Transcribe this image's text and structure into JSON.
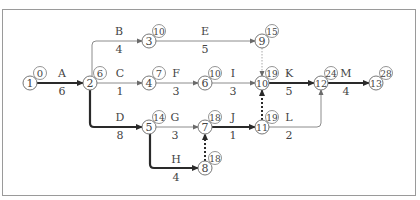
{
  "diagram": {
    "type": "activity-on-arrow network",
    "colors": {
      "line": "#8c8c8c",
      "critical": "#2a2a2a",
      "text": "#444444",
      "frame": "#9a9a9a"
    },
    "nodes": [
      {
        "id": "1",
        "x": 30,
        "y": 83,
        "est": "0"
      },
      {
        "id": "2",
        "x": 90,
        "y": 83,
        "est": "6"
      },
      {
        "id": "3",
        "x": 149,
        "y": 41,
        "est": "10"
      },
      {
        "id": "4",
        "x": 149,
        "y": 83,
        "est": "7"
      },
      {
        "id": "5",
        "x": 149,
        "y": 127,
        "est": "14"
      },
      {
        "id": "6",
        "x": 205,
        "y": 83,
        "est": "10"
      },
      {
        "id": "7",
        "x": 205,
        "y": 127,
        "est": "18"
      },
      {
        "id": "8",
        "x": 205,
        "y": 168,
        "est": "18"
      },
      {
        "id": "9",
        "x": 262,
        "y": 41,
        "est": "15"
      },
      {
        "id": "10",
        "x": 262,
        "y": 83,
        "est": "19"
      },
      {
        "id": "11",
        "x": 262,
        "y": 127,
        "est": "19"
      },
      {
        "id": "12",
        "x": 321,
        "y": 83,
        "est": "24"
      },
      {
        "id": "13",
        "x": 376,
        "y": 83,
        "est": "28"
      }
    ],
    "activities": [
      {
        "name": "A",
        "duration": "6",
        "from": "1",
        "to": "2",
        "critical": true,
        "path": "M37,83 L83,83",
        "lx": 62,
        "ly": 77,
        "dy": 95
      },
      {
        "name": "B",
        "duration": "4",
        "from": "2",
        "to": "3",
        "critical": false,
        "path": "M92,76 L92,45 Q92,41 96,41 L142,41",
        "lx": 119,
        "ly": 35,
        "dy": 53
      },
      {
        "name": "C",
        "duration": "1",
        "from": "2",
        "to": "4",
        "critical": false,
        "path": "M97,83 L142,83",
        "lx": 120,
        "ly": 77,
        "dy": 95
      },
      {
        "name": "D",
        "duration": "8",
        "from": "2",
        "to": "5",
        "critical": true,
        "path": "M90,90 L90,123 Q90,127 94,127 L142,127",
        "lx": 120,
        "ly": 121,
        "dy": 139
      },
      {
        "name": "E",
        "duration": "5",
        "from": "3",
        "to": "9",
        "critical": false,
        "path": "M156,41 L255,41",
        "lx": 205,
        "ly": 35,
        "dy": 53
      },
      {
        "name": "F",
        "duration": "3",
        "from": "4",
        "to": "6",
        "critical": false,
        "path": "M156,83 L198,83",
        "lx": 176,
        "ly": 77,
        "dy": 95
      },
      {
        "name": "G",
        "duration": "3",
        "from": "5",
        "to": "7",
        "critical": false,
        "path": "M156,127 L198,127",
        "lx": 175,
        "ly": 121,
        "dy": 139
      },
      {
        "name": "H",
        "duration": "4",
        "from": "5",
        "to": "8",
        "critical": true,
        "path": "M150,134 L150,164 Q150,168 154,168 L198,168",
        "lx": 176,
        "ly": 163,
        "dy": 181
      },
      {
        "name": "I",
        "duration": "3",
        "from": "6",
        "to": "10",
        "critical": false,
        "path": "M212,83 L255,83",
        "lx": 233,
        "ly": 77,
        "dy": 95
      },
      {
        "name": "J",
        "duration": "1",
        "from": "7",
        "to": "11",
        "critical": true,
        "path": "M212,127 L255,127",
        "lx": 233,
        "ly": 121,
        "dy": 139
      },
      {
        "name": "K",
        "duration": "5",
        "from": "10",
        "to": "12",
        "critical": true,
        "path": "M269,83 L314,83",
        "lx": 289,
        "ly": 77,
        "dy": 95
      },
      {
        "name": "L",
        "duration": "2",
        "from": "11",
        "to": "12",
        "critical": false,
        "path": "M269,127 L317,127 Q321,127 321,123 L321,90",
        "lx": 289,
        "ly": 121,
        "dy": 139
      },
      {
        "name": "M",
        "duration": "4",
        "from": "12",
        "to": "13",
        "critical": true,
        "path": "M328,83 L369,83",
        "lx": 346,
        "ly": 77,
        "dy": 95
      }
    ],
    "dummies": [
      {
        "from": "9",
        "to": "10",
        "critical": false,
        "path": "M262,48 L262,76"
      },
      {
        "from": "8",
        "to": "7",
        "critical": true,
        "path": "M205,161 L205,134"
      },
      {
        "from": "11",
        "to": "10",
        "critical": true,
        "path": "M262,120 L262,90"
      }
    ]
  }
}
